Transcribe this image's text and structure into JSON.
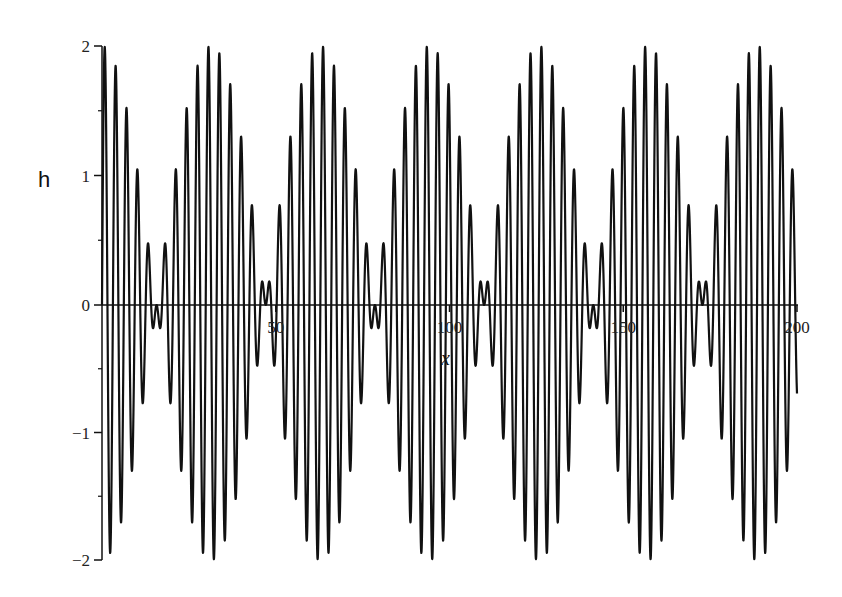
{
  "chart_data": {
    "type": "line",
    "title": "",
    "xlabel": "x",
    "ylabel": "h",
    "xlim": [
      0,
      200
    ],
    "ylim": [
      -2,
      2
    ],
    "grid": false,
    "legend": null,
    "x_ticks": [
      {
        "value": 50,
        "label": "50"
      },
      {
        "value": 100,
        "label": "100"
      },
      {
        "value": 150,
        "label": "150"
      },
      {
        "value": 200,
        "label": "200"
      }
    ],
    "y_ticks": [
      {
        "value": 2,
        "label": "2"
      },
      {
        "value": 1,
        "label": "1"
      },
      {
        "value": 0,
        "label": "0"
      },
      {
        "value": -1,
        "label": "−1"
      },
      {
        "value": -2,
        "label": "−2"
      }
    ],
    "y_minor_ticks": [
      1.5,
      0.5,
      -0.5,
      -1.5
    ],
    "series": [
      {
        "name": "h",
        "expression": "sin(2.1 x) + sin(1.9 x) = 2 sin(2x) cos(0.1x)",
        "components": [
          {
            "amplitude": 1,
            "omega": 2.1
          },
          {
            "amplitude": 1,
            "omega": 1.9
          }
        ],
        "envelope_nodes_x": [
          15.7,
          47.1,
          78.5,
          110.0,
          141.4,
          172.8
        ],
        "max_amplitude": 2,
        "value_at_x0": 0,
        "value_at_x200": -0.69,
        "sample_step": 0.05,
        "color": "#111111"
      }
    ]
  },
  "axes": {
    "x_title": "x",
    "y_title": "h",
    "ticks": {
      "x": [
        "50",
        "100",
        "150",
        "200"
      ],
      "y": [
        "2",
        "1",
        "0",
        "−1",
        "−2"
      ]
    }
  }
}
